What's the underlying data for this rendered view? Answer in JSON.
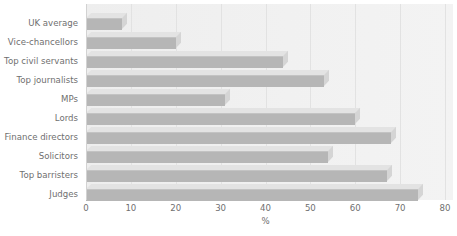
{
  "chart_data": {
    "type": "bar",
    "orientation": "horizontal",
    "title": "",
    "xlabel": "%",
    "ylabel": "",
    "xlim": [
      0,
      80
    ],
    "xticks": [
      0,
      10,
      20,
      30,
      40,
      50,
      60,
      70,
      80
    ],
    "grid": true,
    "legend": false,
    "style": "3d-extruded-bars",
    "colors": {
      "bar_front": "#b6b6b6",
      "bar_top": "#e3e3e3",
      "bar_side": "#d5d5d5",
      "plot_background": "#efefef",
      "gridline": "#e2e2e2",
      "text": "#6f6f6f",
      "page_background": "#ffffff"
    },
    "categories": [
      "UK average",
      "Vice-chancellors",
      "Top civil servants",
      "Top journalists",
      "MPs",
      "Lords",
      "Finance directors",
      "Solicitors",
      "Top barristers",
      "Judges"
    ],
    "values": [
      8,
      20,
      44,
      53,
      31,
      60,
      68,
      54,
      67,
      74
    ]
  },
  "axis": {
    "x_tick_labels": [
      "0",
      "10",
      "20",
      "30",
      "40",
      "50",
      "60",
      "70",
      "80"
    ],
    "x_axis_title": "%"
  }
}
